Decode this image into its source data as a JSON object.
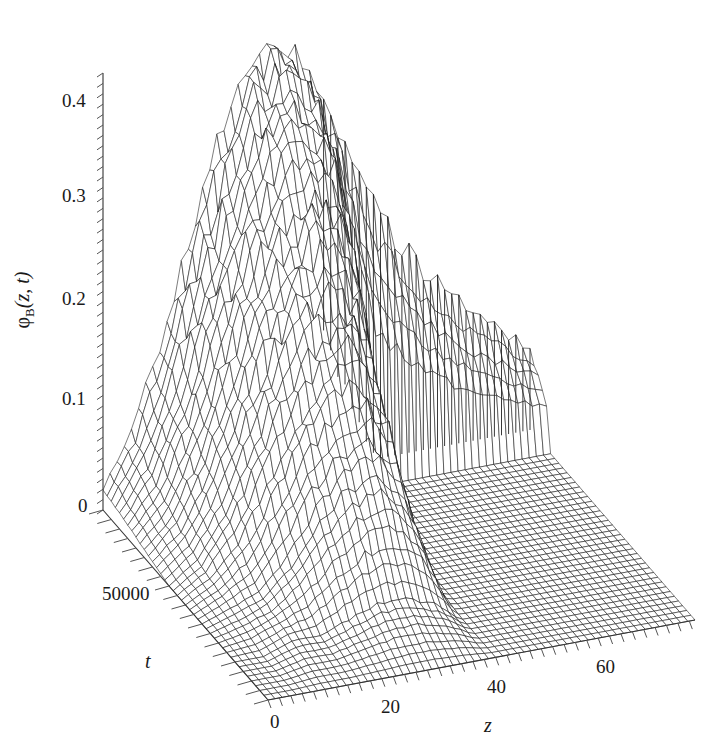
{
  "chart_data": {
    "type": "surface3d",
    "title": "",
    "zlabel": "φB(z, t)",
    "zlabel_main": "φ",
    "zlabel_sub": "B",
    "zlabel_args": "(z, t)",
    "xlabel": "z",
    "ylabel": "t",
    "x_ticks": [
      "0",
      "20",
      "40",
      "60"
    ],
    "x_tick_values": [
      0,
      20,
      40,
      60
    ],
    "y_ticks": [
      "0",
      "50000"
    ],
    "y_tick_values": [
      0,
      50000
    ],
    "z_ticks": [
      "0",
      "0.1",
      "0.2",
      "0.3",
      "0.4"
    ],
    "z_tick_values": [
      0,
      0.1,
      0.2,
      0.3,
      0.4
    ],
    "xlim": [
      0,
      75
    ],
    "ylim": [
      0,
      100000
    ],
    "zlim": [
      0,
      0.42
    ],
    "grid": false,
    "legend": null,
    "z_grid_x": [
      0,
      5,
      10,
      15,
      20,
      25,
      30,
      35,
      40,
      45,
      50,
      55,
      60,
      65,
      70,
      75
    ],
    "z_grid_t": [
      0,
      20000,
      40000,
      60000,
      80000,
      100000
    ],
    "z_grid_values": [
      [
        0.0,
        0.0,
        0.0,
        0.0,
        0.0,
        0.0,
        0.0,
        0.0,
        0.0,
        0.0,
        0.0,
        0.0,
        0.0,
        0.0,
        0.0,
        0.0
      ],
      [
        0.0,
        0.0,
        0.01,
        0.01,
        0.02,
        0.03,
        0.03,
        0.02,
        0.0,
        0.0,
        0.0,
        0.0,
        0.0,
        0.0,
        0.0,
        0.0
      ],
      [
        0.0,
        0.01,
        0.02,
        0.05,
        0.09,
        0.12,
        0.13,
        0.1,
        0.01,
        0.0,
        0.0,
        0.0,
        0.0,
        0.0,
        0.0,
        0.0
      ],
      [
        0.0,
        0.02,
        0.06,
        0.12,
        0.18,
        0.22,
        0.24,
        0.2,
        0.03,
        0.0,
        0.0,
        0.0,
        0.0,
        0.0,
        0.0,
        0.0
      ],
      [
        0.01,
        0.04,
        0.1,
        0.18,
        0.26,
        0.32,
        0.35,
        0.33,
        0.22,
        0.02,
        0.01,
        0.0,
        0.0,
        0.0,
        0.0,
        0.0
      ],
      [
        0.02,
        0.07,
        0.15,
        0.24,
        0.33,
        0.4,
        0.42,
        0.4,
        0.33,
        0.27,
        0.22,
        0.18,
        0.15,
        0.12,
        0.1,
        0.08
      ]
    ]
  },
  "layout": {
    "origin": [
      103,
      510
    ],
    "x_axis_end": [
      695,
      620
    ],
    "t_axis_end_front": [
      268,
      700
    ],
    "z_axis_top": [
      103,
      73
    ]
  }
}
